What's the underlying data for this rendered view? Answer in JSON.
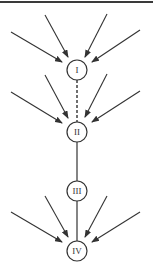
{
  "diagram": {
    "colors": {
      "stroke": "#333333",
      "background": "#ffffff",
      "border": "#3a3a3a"
    },
    "nodes": [
      {
        "id": "I",
        "label": "I",
        "cx": 77,
        "cy": 70,
        "r": 10
      },
      {
        "id": "II",
        "label": "II",
        "cx": 77,
        "cy": 132,
        "r": 10
      },
      {
        "id": "III",
        "label": "III",
        "cx": 77,
        "cy": 191,
        "r": 10
      },
      {
        "id": "IV",
        "label": "IV",
        "cx": 77,
        "cy": 251,
        "r": 10
      }
    ],
    "connectors": [
      {
        "from": "I",
        "to": "II",
        "style": "dashed"
      },
      {
        "from": "II",
        "to": "III",
        "style": "solid"
      },
      {
        "from": "III",
        "to": "IV",
        "style": "solid"
      }
    ],
    "incoming_arrow_groups": [
      {
        "target": "I",
        "count": 4
      },
      {
        "target": "II",
        "count": 4
      },
      {
        "target": "IV",
        "count": 4
      }
    ]
  }
}
